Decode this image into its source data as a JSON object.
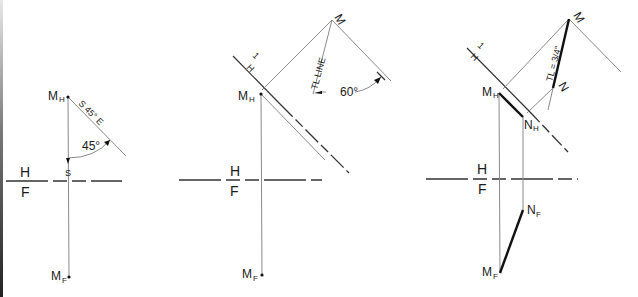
{
  "figure": {
    "panels": [
      {
        "id": "step-1",
        "labels": {
          "point_top": "M",
          "point_top_sub": "H",
          "point_bottom": "M",
          "point_bottom_sub": "F",
          "bearing": "S 45° E",
          "angle": "45°",
          "south_marker": "S",
          "fold_top": "H",
          "fold_bottom": "F"
        }
      },
      {
        "id": "step-2",
        "labels": {
          "point_top": "M",
          "point_top_sub": "H",
          "point_bottom": "M",
          "point_bottom_sub": "F",
          "aux_point": "M",
          "aux_point_sup": "1",
          "fold_aux_top": "H",
          "fold_aux_bottom": "1",
          "tl_line": "TL LINE",
          "angle": "60°",
          "fold_top": "H",
          "fold_bottom": "F"
        }
      },
      {
        "id": "step-3",
        "labels": {
          "point_m_top": "M",
          "point_m_top_sub": "H",
          "point_n_top": "N",
          "point_n_top_sub": "H",
          "point_m_bottom": "M",
          "point_m_bottom_sub": "F",
          "point_n_bottom": "N",
          "point_n_bottom_sub": "F",
          "aux_m": "M",
          "aux_m_sup": "1",
          "aux_n": "N",
          "aux_n_sup": "1",
          "fold_aux_top": "H",
          "fold_aux_bottom": "1",
          "tl_value": "TL = 3/4\"",
          "fold_top": "H",
          "fold_bottom": "F"
        }
      }
    ]
  }
}
